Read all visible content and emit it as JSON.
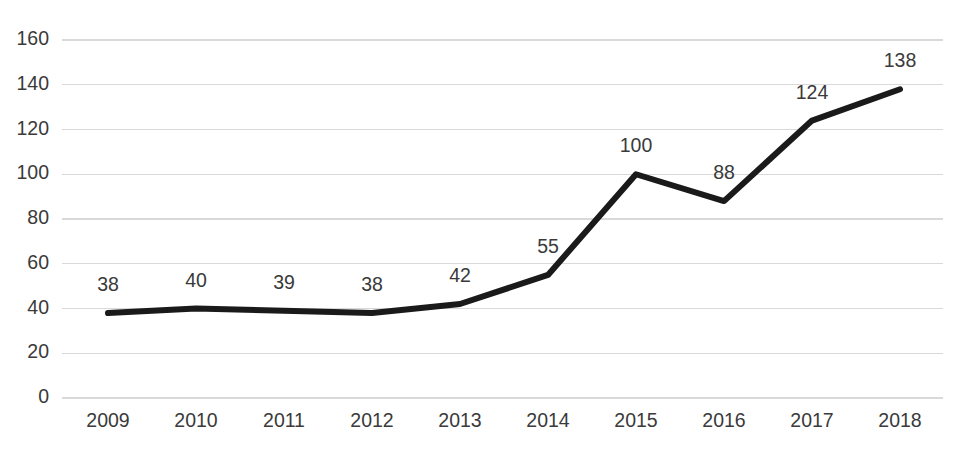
{
  "chart_data": {
    "type": "line",
    "title": "",
    "subtitle": "",
    "xlabel": "",
    "ylabel": "",
    "categories": [
      "2009",
      "2010",
      "2011",
      "2012",
      "2013",
      "2014",
      "2015",
      "2016",
      "2017",
      "2018"
    ],
    "values": [
      38,
      40,
      39,
      38,
      42,
      55,
      100,
      88,
      124,
      138
    ],
    "data_labels": [
      "38",
      "40",
      "39",
      "38",
      "42",
      "55",
      "100",
      "88",
      "124",
      "138"
    ],
    "series": [
      {
        "name": "",
        "values": [
          38,
          40,
          39,
          38,
          42,
          55,
          100,
          88,
          124,
          138
        ],
        "color": "#1a1a1a"
      }
    ],
    "ylim": [
      0,
      160
    ],
    "ytick_step": 20,
    "ytick_labels": [
      "0",
      "20",
      "40",
      "60",
      "80",
      "100",
      "120",
      "140",
      "160"
    ],
    "ytick_values": [
      0,
      20,
      40,
      60,
      80,
      100,
      120,
      140,
      160
    ],
    "xtick_labels": [
      "2009",
      "2010",
      "2011",
      "2012",
      "2013",
      "2014",
      "2015",
      "2016",
      "2017",
      "2018"
    ],
    "grid": {
      "horizontal": true,
      "vertical": false,
      "color": "#d9d9d9"
    },
    "legend": {
      "visible": false,
      "position": "none",
      "entries": []
    },
    "markers": false,
    "data_labels_visible": true,
    "background_color": "#ffffff",
    "line_color": "#1a1a1a",
    "text_color": "#3a3a3a"
  }
}
